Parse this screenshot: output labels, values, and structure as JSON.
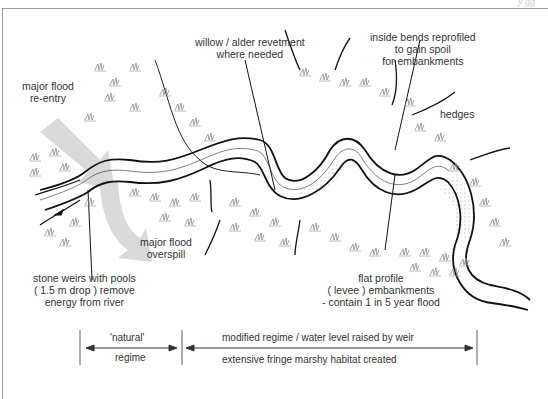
{
  "header": {
    "running_head": "y  gg"
  },
  "labels": {
    "flood_reentry": [
      "major flood",
      "re-entry"
    ],
    "revetment": [
      "willow / alder revetment",
      "where needed"
    ],
    "inside_bends": [
      "inside bends reprofiled",
      "to gain spoil",
      "for embankments"
    ],
    "hedges": "hedges",
    "flood_overspill": [
      "major flood",
      "overspill"
    ],
    "stone_weirs": [
      "stone weirs with pools",
      "( 1.5 m drop ) remove",
      "energy from river"
    ],
    "embankments": [
      "flat profile",
      "( levee ) embankments",
      "- contain 1 in 5 year flood"
    ]
  },
  "scale_bar": {
    "natural_top": "'natural'",
    "natural_bottom": "regime",
    "modified_top": "modified regime / water level raised by weir",
    "modified_bottom": "extensive fringe marshy habitat created"
  },
  "colors": {
    "river_line": "#111111",
    "arrow_fill": "#d9d9d9",
    "marsh_symbol": "#8a8a8a",
    "frame": "#9a9a9a",
    "text": "#333333"
  }
}
